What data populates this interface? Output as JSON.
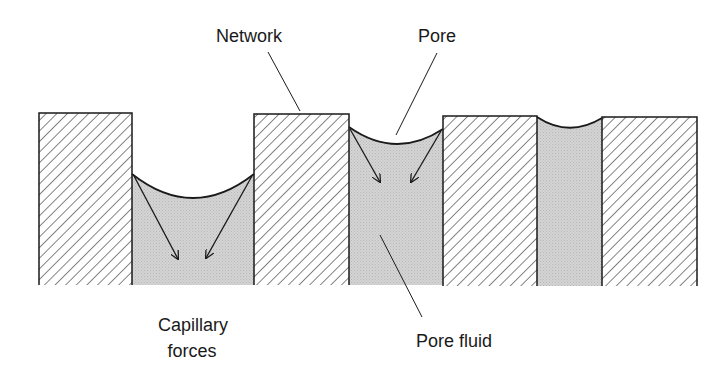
{
  "diagram": {
    "labels": {
      "network": "Network",
      "pore": "Pore",
      "capillary_line1": "Capillary",
      "capillary_line2": "forces",
      "pore_fluid": "Pore fluid"
    },
    "colors": {
      "outline": "#1a1a1a",
      "hatch": "#333333",
      "fluid": "#cfcfcf",
      "background": "#ffffff"
    }
  }
}
